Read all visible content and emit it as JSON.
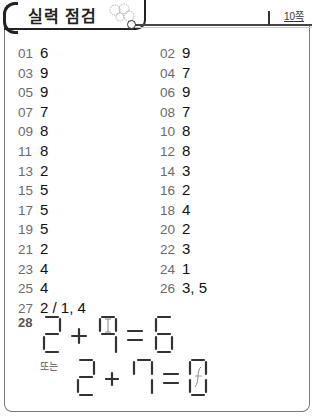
{
  "header": {
    "title": "실력 점검",
    "page_label": "10쪽"
  },
  "answers": [
    {
      "num": "01",
      "value": "6"
    },
    {
      "num": "02",
      "value": "9"
    },
    {
      "num": "03",
      "value": "9"
    },
    {
      "num": "04",
      "value": "7"
    },
    {
      "num": "05",
      "value": "9"
    },
    {
      "num": "06",
      "value": "9"
    },
    {
      "num": "07",
      "value": "7"
    },
    {
      "num": "08",
      "value": "7"
    },
    {
      "num": "09",
      "value": "8"
    },
    {
      "num": "10",
      "value": "8"
    },
    {
      "num": "11",
      "value": "8"
    },
    {
      "num": "12",
      "value": "8"
    },
    {
      "num": "13",
      "value": "2"
    },
    {
      "num": "14",
      "value": "3"
    },
    {
      "num": "15",
      "value": "5"
    },
    {
      "num": "16",
      "value": "2"
    },
    {
      "num": "17",
      "value": "5"
    },
    {
      "num": "18",
      "value": "4"
    },
    {
      "num": "19",
      "value": "5"
    },
    {
      "num": "20",
      "value": "2"
    },
    {
      "num": "21",
      "value": "2"
    },
    {
      "num": "22",
      "value": "3"
    },
    {
      "num": "23",
      "value": "4"
    },
    {
      "num": "24",
      "value": "1"
    },
    {
      "num": "25",
      "value": "4"
    },
    {
      "num": "26",
      "value": "3, 5"
    },
    {
      "num": "27",
      "value": "2 / 1, 4"
    }
  ],
  "q28": {
    "num": "28",
    "equation1": "2 + 4 = 6",
    "or_label": "또는",
    "equation2": "2 + 7 = 9"
  }
}
